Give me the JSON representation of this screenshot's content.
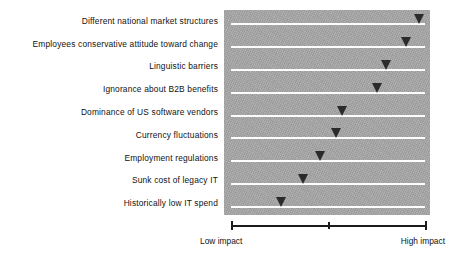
{
  "chart_data": {
    "type": "bar",
    "title": "",
    "subtitle": "",
    "xlabel": "",
    "ylabel": "",
    "orientation": "horizontal",
    "marker_style": "down-triangle",
    "grid": true,
    "legend": false,
    "plot_background_color": "#a8a8a8",
    "grid_line_color": "#fdfdfd",
    "marker_color": "#2b2b2b",
    "axis_color": "#1c1c1c",
    "xlim": [
      0,
      100
    ],
    "axis_tick_values": [
      0,
      50,
      100
    ],
    "axis_tick_labels": [
      "Low impact",
      "",
      "High impact"
    ],
    "axis_endpoint_labels": {
      "low": "Low impact",
      "high": "High impact"
    },
    "categories": [
      "Different national market structures",
      "Employees conservative attitude toward change",
      "Linguistic barriers",
      "Ignorance about B2B benefits",
      "Dominance of US software vendors",
      "Currency fluctuations",
      "Employment regulations",
      "Sunk cost of legacy IT",
      "Historically low IT spend"
    ],
    "values": [
      97,
      90,
      80,
      75,
      57,
      54,
      46,
      37,
      26
    ],
    "points": [
      {
        "category": "Different national market structures",
        "value": 97
      },
      {
        "category": "Employees conservative attitude toward change",
        "value": 90
      },
      {
        "category": "Linguistic barriers",
        "value": 80
      },
      {
        "category": "Ignorance about B2B benefits",
        "value": 75
      },
      {
        "category": "Dominance of US software vendors",
        "value": 57
      },
      {
        "category": "Currency fluctuations",
        "value": 54
      },
      {
        "category": "Employment regulations",
        "value": 46
      },
      {
        "category": "Sunk cost of legacy IT",
        "value": 37
      },
      {
        "category": "Historically low IT spend",
        "value": 26
      }
    ]
  }
}
